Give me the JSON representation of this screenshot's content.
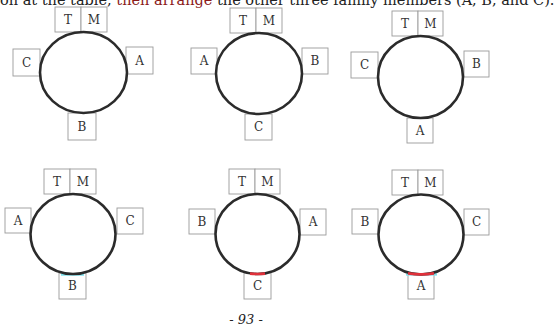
{
  "intro": {
    "part1": "on at the table, ",
    "highlight": "then arrange",
    "part2": " the other three family members (A, B, and C)."
  },
  "colors": {
    "highlight_text": "#8b1a1a",
    "table_stroke": "#2b2b2b",
    "seat_border": "#9a9a9a",
    "accent_cyan": "#7fe3ef",
    "accent_red": "#e0303a"
  },
  "diagrams": [
    {
      "id": 1,
      "top_left": "T",
      "top_right": "M",
      "left": "C",
      "right": "A",
      "bottom": "B",
      "bottom_mark": "none"
    },
    {
      "id": 2,
      "top_left": "T",
      "top_right": "M",
      "left": "A",
      "right": "B",
      "bottom": "C",
      "bottom_mark": "none"
    },
    {
      "id": 3,
      "top_left": "T",
      "top_right": "M",
      "left": "C",
      "right": "B",
      "bottom": "A",
      "bottom_mark": "none"
    },
    {
      "id": 4,
      "top_left": "T",
      "top_right": "M",
      "left": "A",
      "right": "C",
      "bottom": "B",
      "bottom_mark": "cyan"
    },
    {
      "id": 5,
      "top_left": "T",
      "top_right": "M",
      "left": "B",
      "right": "A",
      "bottom": "C",
      "bottom_mark": "red"
    },
    {
      "id": 6,
      "top_left": "T",
      "top_right": "M",
      "left": "B",
      "right": "C",
      "bottom": "A",
      "bottom_mark": "red-cyan"
    }
  ],
  "page_number": "- 93 -"
}
